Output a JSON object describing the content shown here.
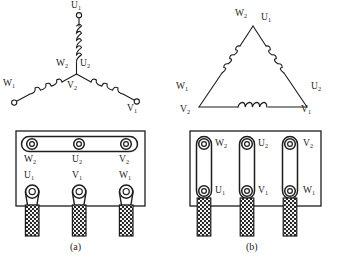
{
  "figure": {
    "line_color": "#1d1d1d",
    "fill_color": "#ffffff",
    "background": "#ffffff"
  },
  "panels": [
    {
      "id": "a",
      "caption": "(a)",
      "connection": "star",
      "schematic_labels": [
        {
          "name": "U",
          "sub": "1",
          "x": 74,
          "y": 3,
          "role": "top-terminal"
        },
        {
          "name": "W",
          "sub": "2",
          "x": 60,
          "y": 62,
          "role": "centre-node"
        },
        {
          "name": "U",
          "sub": "2",
          "x": 83,
          "y": 62,
          "role": "centre-node"
        },
        {
          "name": "V",
          "sub": "2",
          "x": 70,
          "y": 84,
          "role": "centre-node"
        },
        {
          "name": "W",
          "sub": "1",
          "x": 6,
          "y": 82,
          "role": "left-terminal"
        },
        {
          "name": "V",
          "sub": "1",
          "x": 129,
          "y": 104,
          "role": "right-terminal"
        }
      ],
      "terminal_block": {
        "link_type": "horizontal-shorting-bar",
        "top_row": [
          {
            "name": "W",
            "sub": "2"
          },
          {
            "name": "U",
            "sub": "2"
          },
          {
            "name": "V",
            "sub": "2"
          }
        ],
        "bottom_row": [
          {
            "name": "U",
            "sub": "1"
          },
          {
            "name": "V",
            "sub": "1"
          },
          {
            "name": "W",
            "sub": "1"
          }
        ]
      }
    },
    {
      "id": "b",
      "caption": "(b)",
      "connection": "delta",
      "schematic_labels": [
        {
          "name": "W",
          "sub": "2",
          "x": 238,
          "y": 11,
          "role": "apex"
        },
        {
          "name": "U",
          "sub": "1",
          "x": 263,
          "y": 14,
          "role": "apex"
        },
        {
          "name": "W",
          "sub": "1",
          "x": 178,
          "y": 84,
          "role": "left-vertex"
        },
        {
          "name": "V",
          "sub": "2",
          "x": 182,
          "y": 106,
          "role": "left-vertex"
        },
        {
          "name": "U",
          "sub": "2",
          "x": 313,
          "y": 84,
          "role": "right-vertex"
        },
        {
          "name": "V",
          "sub": "1",
          "x": 303,
          "y": 106,
          "role": "right-vertex"
        }
      ],
      "terminal_block": {
        "link_type": "vertical-shorting-bars",
        "top_row": [
          {
            "name": "W",
            "sub": "2"
          },
          {
            "name": "U",
            "sub": "2"
          },
          {
            "name": "V",
            "sub": "2"
          }
        ],
        "bottom_row": [
          {
            "name": "U",
            "sub": "1"
          },
          {
            "name": "V",
            "sub": "1"
          },
          {
            "name": "W",
            "sub": "1"
          }
        ]
      }
    }
  ]
}
